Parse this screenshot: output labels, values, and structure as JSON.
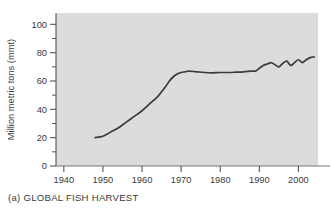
{
  "figure": {
    "caption_letter": "(a)",
    "caption_text": "GLOBAL FISH HARVEST"
  },
  "colors": {
    "plot_background": "#dcdcdc",
    "line": "#3b3b3b",
    "axis": "#555555",
    "text": "#3a3a3a",
    "page_background": "#ffffff"
  },
  "chart_data": {
    "type": "line",
    "xlabel": "",
    "ylabel": "Million metric tons (mmt)",
    "xlim": [
      1938,
      2005
    ],
    "ylim": [
      0,
      108
    ],
    "grid": false,
    "legend": null,
    "x_ticks": [
      1940,
      1950,
      1960,
      1970,
      1980,
      1990,
      2000
    ],
    "x_tick_labels": [
      "1940",
      "1950",
      "1960",
      "1970",
      "1980",
      "1990",
      "2000"
    ],
    "y_ticks": [
      0,
      20,
      40,
      60,
      80,
      100
    ],
    "y_tick_labels": [
      "0",
      "20",
      "40",
      "60",
      "80",
      "100"
    ],
    "y_minor_ticks": [
      10,
      30,
      50,
      70,
      90
    ],
    "series": [
      {
        "name": "Global fish harvest",
        "x": [
          1948,
          1950,
          1952,
          1954,
          1956,
          1958,
          1960,
          1962,
          1964,
          1966,
          1967,
          1968,
          1969,
          1970,
          1971,
          1972,
          1974,
          1976,
          1978,
          1980,
          1982,
          1984,
          1986,
          1988,
          1989,
          1990,
          1991,
          1992,
          1993,
          1994,
          1995,
          1996,
          1997,
          1998,
          1999,
          2000,
          2001,
          2002,
          2003,
          2004
        ],
        "values": [
          20,
          21,
          24,
          27,
          31,
          35,
          39,
          44,
          49,
          56,
          60,
          63,
          65,
          66,
          66.5,
          67,
          66.5,
          66,
          65.8,
          66,
          66,
          66.2,
          66.5,
          67,
          67,
          69,
          71,
          72,
          73,
          71.5,
          70,
          72.5,
          74,
          71,
          73,
          75,
          73,
          75,
          76.5,
          77
        ]
      }
    ]
  },
  "axes": {
    "y_axis_title": "Million metric tons (mmt)"
  }
}
